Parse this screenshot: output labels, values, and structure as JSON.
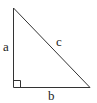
{
  "diagram": {
    "type": "right-triangle",
    "labels": {
      "a": "a",
      "b": "b",
      "c": "c"
    },
    "colors": {
      "stroke": "#333333",
      "text": "#222222",
      "background": "#ffffff"
    }
  }
}
